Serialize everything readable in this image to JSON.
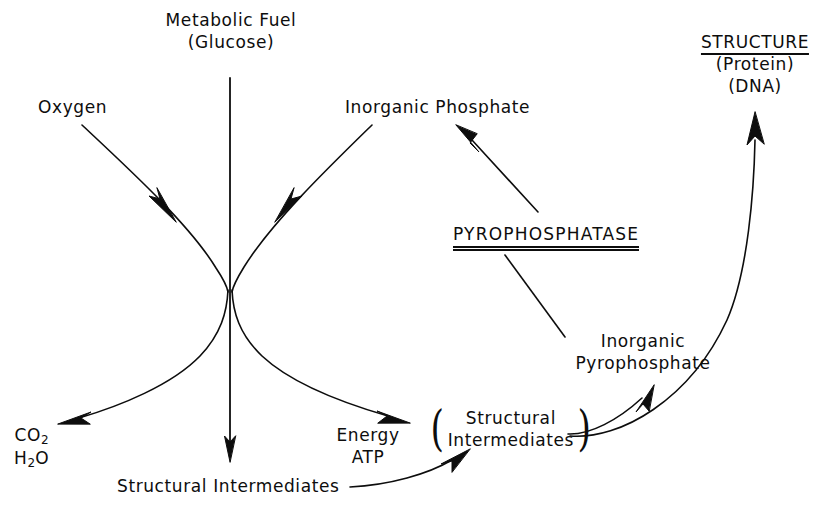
{
  "diagram": {
    "background_color": "#ffffff",
    "ink_color": "#0d0d0d",
    "nodes": {
      "metabolic_fuel_line1": "Metabolic Fuel",
      "metabolic_fuel_line2": "(Glucose)",
      "oxygen": "Oxygen",
      "inorganic_phosphate": "Inorganic Phosphate",
      "structure_heading": "STRUCTURE",
      "structure_line2": "(Protein)",
      "structure_line3": "(DNA)",
      "pyrophosphatase": "PYROPHOSPHATASE",
      "inorganic_pyrophosphate_line1": "Inorganic",
      "inorganic_pyrophosphate_line2": "Pyrophosphate",
      "co2_formula": "CO",
      "co2_subscript": "2",
      "h2o_formula_part1": "H",
      "h2o_subscript": "2",
      "h2o_formula_part2": "O",
      "energy": "Energy",
      "atp": "ATP",
      "oval_line1": "Structural",
      "oval_line2": "Intermediates",
      "oval_left_paren": "(",
      "oval_right_paren": ")",
      "structural_intermediates_bottom": "Structural Intermediates"
    },
    "edges": [
      {
        "name": "oxygen-to-waist",
        "from": "Oxygen",
        "to": "central crossing point",
        "style": "curved-with-arrowhead-midway"
      },
      {
        "name": "phosphate-to-waist",
        "from": "Inorganic Phosphate",
        "to": "central crossing point",
        "style": "curved-with-arrowhead-midway"
      },
      {
        "name": "waist-to-co2-h2o",
        "from": "central crossing point",
        "to": "CO2 / H2O",
        "style": "curved-arrow"
      },
      {
        "name": "waist-to-energy-atp",
        "from": "central crossing point",
        "to": "Energy / ATP",
        "style": "curved-arrow"
      },
      {
        "name": "fuel-down-arrow",
        "from": "Metabolic Fuel (Glucose)",
        "to": "Structural Intermediates",
        "style": "straight-vertical-arrow"
      },
      {
        "name": "bottom-intermediates-to-oval",
        "from": "Structural Intermediates",
        "to": "(Structural Intermediates)",
        "style": "curved-arrow"
      },
      {
        "name": "oval-to-pyrophosphate",
        "from": "(Structural Intermediates)",
        "to": "Inorganic Pyrophosphate",
        "style": "short-curved-arrow"
      },
      {
        "name": "oval-to-structure",
        "from": "(Structural Intermediates)",
        "to": "STRUCTURE (Protein) (DNA)",
        "style": "long-curved-arrow"
      },
      {
        "name": "pyrophosphate-to-phosphate",
        "from": "Inorganic Pyrophosphate",
        "to": "Inorganic Phosphate",
        "style": "straight-arrow-through-enzyme-label"
      }
    ]
  }
}
